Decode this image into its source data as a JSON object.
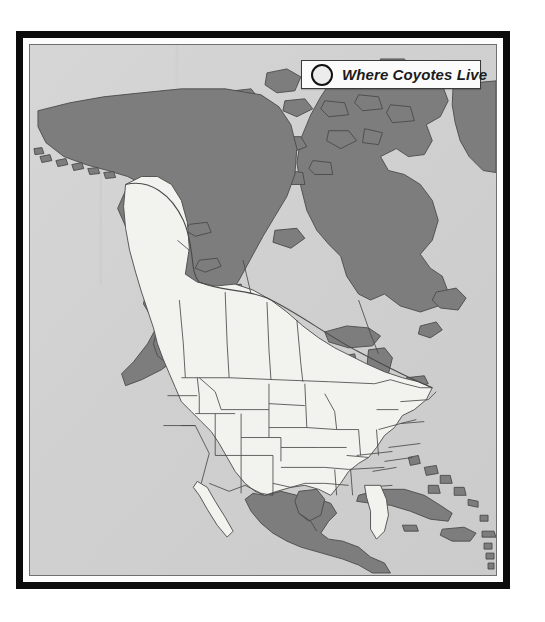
{
  "map": {
    "title": "Where Coyotes Live",
    "subject": "coyote-range-north-america",
    "legend": {
      "icon": "circle-outline-icon",
      "label": "Where Coyotes Live"
    },
    "colors": {
      "frame": "#0b0b0b",
      "mat": "#fdfdfd",
      "ocean_background": "#d2d2d2",
      "range_fill": "#f2f2ee",
      "outside_range_fill": "#7d7d7d",
      "border_line": "#4a4a4a",
      "legend_background": "#fbfbfb",
      "legend_text": "#1b1b1b"
    },
    "regions": {
      "in_range_label": "Coyote range (light)",
      "out_of_range_label": "Outside coyote range (dark)"
    }
  }
}
